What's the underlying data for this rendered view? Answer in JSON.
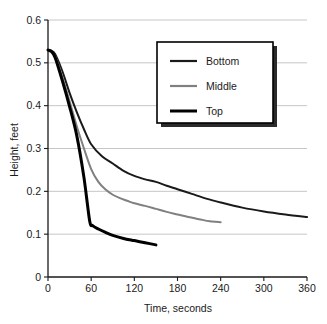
{
  "chart_data": {
    "type": "line",
    "title": "",
    "xlabel": "Time, seconds",
    "ylabel": "Height, feet",
    "xlim": [
      0,
      360
    ],
    "ylim": [
      0,
      0.6
    ],
    "xticks": [
      "0",
      "60",
      "120",
      "180",
      "240",
      "300",
      "360"
    ],
    "yticks": [
      "0",
      "0.1",
      "0.2",
      "0.3",
      "0.4",
      "0.5",
      "0.6"
    ],
    "xtick_values": [
      0,
      60,
      120,
      180,
      240,
      300,
      360
    ],
    "ytick_values": [
      0,
      0.1,
      0.2,
      0.3,
      0.4,
      0.5,
      0.6
    ],
    "grid": "horizontal",
    "legend_position": "upper-center-right",
    "series": [
      {
        "name": "Bottom",
        "color": "#1a1a1a",
        "width": 2.0,
        "x": [
          0,
          5,
          10,
          20,
          30,
          40,
          50,
          60,
          75,
          90,
          105,
          120,
          135,
          150,
          165,
          180,
          200,
          220,
          240,
          270,
          300,
          330,
          360
        ],
        "values": [
          0.53,
          0.528,
          0.52,
          0.48,
          0.43,
          0.385,
          0.345,
          0.31,
          0.282,
          0.265,
          0.248,
          0.236,
          0.228,
          0.222,
          0.213,
          0.205,
          0.194,
          0.183,
          0.174,
          0.162,
          0.153,
          0.146,
          0.14
        ]
      },
      {
        "name": "Middle",
        "color": "#808080",
        "width": 2.0,
        "x": [
          0,
          5,
          10,
          20,
          30,
          40,
          50,
          60,
          70,
          80,
          90,
          100,
          110,
          120,
          135,
          150,
          165,
          180,
          195,
          210,
          225,
          240
        ],
        "values": [
          0.53,
          0.527,
          0.515,
          0.467,
          0.41,
          0.352,
          0.3,
          0.252,
          0.222,
          0.204,
          0.192,
          0.184,
          0.178,
          0.172,
          0.166,
          0.159,
          0.152,
          0.146,
          0.14,
          0.135,
          0.13,
          0.128
        ]
      },
      {
        "name": "Top",
        "color": "#000000",
        "width": 3.0,
        "x": [
          0,
          5,
          10,
          20,
          30,
          40,
          50,
          58,
          62,
          70,
          80,
          90,
          105,
          120,
          135,
          150
        ],
        "values": [
          0.53,
          0.526,
          0.512,
          0.458,
          0.398,
          0.33,
          0.232,
          0.13,
          0.12,
          0.112,
          0.104,
          0.097,
          0.09,
          0.085,
          0.08,
          0.075
        ]
      }
    ]
  },
  "legend": {
    "entries": [
      {
        "label": "Bottom"
      },
      {
        "label": "Middle"
      },
      {
        "label": "Top"
      }
    ]
  }
}
